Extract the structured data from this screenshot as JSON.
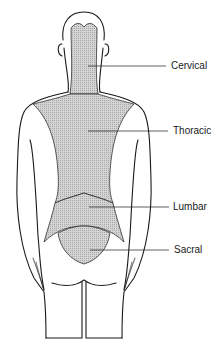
{
  "diagram": {
    "colors": {
      "outline": "#1a1a1a",
      "region_fill": "#c8c8c8",
      "background": "#ffffff"
    },
    "regions": [
      {
        "id": "cervical",
        "label": "Cervical",
        "label_x": 171,
        "label_y": 63,
        "pointer_from": [
          88,
          66
        ],
        "pointer_to": [
          166,
          66
        ]
      },
      {
        "id": "thoracic",
        "label": "Thoracic",
        "label_x": 173,
        "label_y": 127,
        "pointer_from": [
          88,
          131
        ],
        "pointer_to": [
          168,
          131
        ]
      },
      {
        "id": "lumbar",
        "label": "Lumbar",
        "label_x": 173,
        "label_y": 200,
        "pointer_from": [
          89,
          207
        ],
        "pointer_to": [
          169,
          207
        ]
      },
      {
        "id": "sacral",
        "label": "Sacral",
        "label_x": 174,
        "label_y": 242,
        "pointer_from": [
          90,
          250
        ],
        "pointer_to": [
          169,
          250
        ]
      }
    ]
  }
}
